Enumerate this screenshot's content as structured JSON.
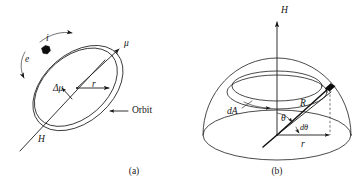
{
  "figure": {
    "background_color": "#ffffff",
    "ink_color": "#141414",
    "panels": [
      {
        "id": "panel-a",
        "caption": "(a)",
        "caption_x": 134,
        "caption_y": 172,
        "description": "Electron orbit loop with magnetic moment vectors in an applied field H",
        "labels": [
          {
            "name": "current-label",
            "text": "i",
            "x": 46,
            "y": 39,
            "style": "italic"
          },
          {
            "name": "electron-label",
            "text": "e",
            "x": 25,
            "y": 60,
            "style": "italic"
          },
          {
            "name": "moment-label",
            "text": "μ",
            "x": 124,
            "y": 44,
            "style": "italic"
          },
          {
            "name": "delta-moment-label",
            "text": "Δμ",
            "x": 58,
            "y": 89,
            "style": "italic"
          },
          {
            "name": "radius-label",
            "text": "r",
            "x": 92,
            "y": 88,
            "style": "italic"
          },
          {
            "name": "orbit-label",
            "text": "Orbit",
            "x": 134,
            "y": 111,
            "style": "upright"
          },
          {
            "name": "field-label",
            "text": "H",
            "x": 38,
            "y": 140,
            "style": "italic"
          }
        ]
      },
      {
        "id": "panel-b",
        "caption": "(b)",
        "caption_x": 277,
        "caption_y": 172,
        "description": "Hemisphere of magnetic moment directions showing annular element dA at polar angle theta",
        "labels": [
          {
            "name": "field-axis-label",
            "text": "H",
            "x": 283,
            "y": 11,
            "style": "italic"
          },
          {
            "name": "area-element-label",
            "text": "dA",
            "x": 232,
            "y": 110,
            "style": "italic"
          },
          {
            "name": "sphere-radius-label",
            "text": "R",
            "x": 300,
            "y": 103,
            "style": "italic"
          },
          {
            "name": "theta-label",
            "text": "θ",
            "x": 283,
            "y": 119,
            "style": "italic"
          },
          {
            "name": "dtheta-label",
            "text": "dθ",
            "x": 301,
            "y": 128,
            "style": "italic"
          },
          {
            "name": "projected-radius-label",
            "text": "r",
            "x": 303,
            "y": 143,
            "style": "italic"
          }
        ]
      }
    ]
  }
}
